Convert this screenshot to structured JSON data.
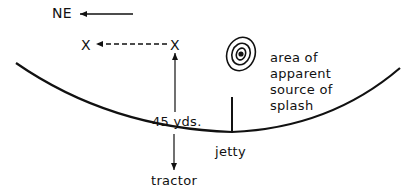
{
  "diagram": {
    "compass": {
      "label": "NE",
      "direction": "left"
    },
    "markers": {
      "x_left": "X",
      "x_right": "X"
    },
    "distance_label": "45 yds.",
    "jetty_label": "jetty",
    "tractor_label": "tractor",
    "splash_area": {
      "lines": [
        "area of",
        "apparent",
        "source of",
        "splash"
      ]
    },
    "colors": {
      "ink": "#111111",
      "background": "#ffffff"
    }
  }
}
